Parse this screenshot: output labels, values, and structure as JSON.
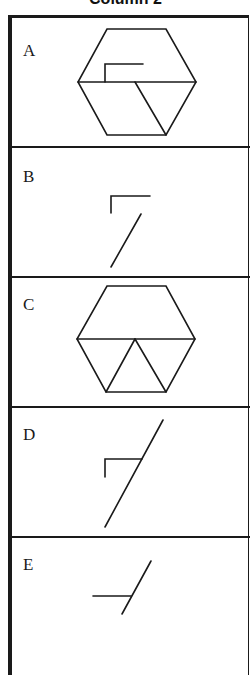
{
  "header": {
    "title": "Column 2"
  },
  "options": [
    {
      "label": "A",
      "figure": "hexagon-with-horizontal-midline-inner-bracket-and-lower-right-diagonal"
    },
    {
      "label": "B",
      "figure": "corner-bracket-and-separate-diagonal"
    },
    {
      "label": "C",
      "figure": "hexagon-with-horizontal-midline-and-inverted-v-triangle"
    },
    {
      "label": "D",
      "figure": "long-diagonal-crossing-corner-bracket"
    },
    {
      "label": "E",
      "figure": "short-diagonal-with-horizontal-stub"
    }
  ],
  "colors": {
    "line": "#1a1a1a",
    "background": "#ffffff"
  }
}
